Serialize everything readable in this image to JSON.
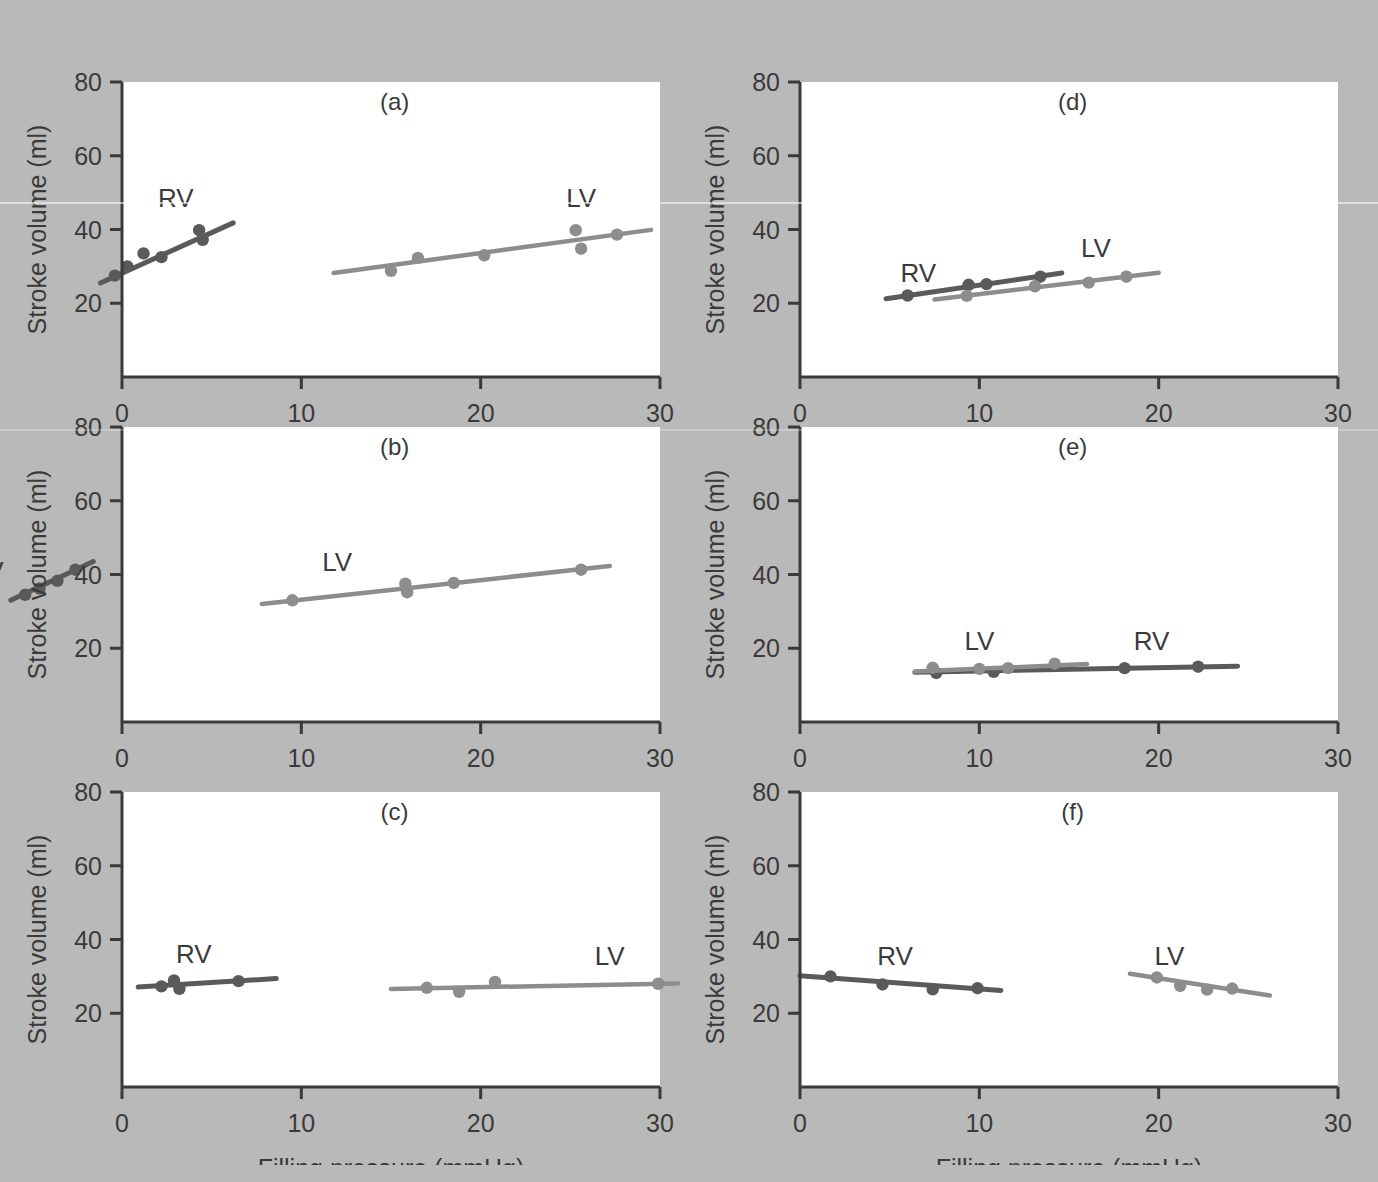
{
  "figure": {
    "background_color": "#b9b9b9",
    "plot_background_color": "#ffffff",
    "axis_color": "#3a3a3a",
    "rv_color": "#5a5a5a",
    "lv_color": "#8d8d8d",
    "x_axis_title": "Filling pressure (mmHg)",
    "y_axis_title": "Stroke volume (ml)",
    "x_ticks": [
      "0",
      "10",
      "20",
      "30"
    ],
    "y_ticks": [
      "20",
      "40",
      "60",
      "80"
    ],
    "series_labels": {
      "rv": "RV",
      "lv": "LV"
    },
    "panel_letters": [
      "(a)",
      "(b)",
      "(c)",
      "(d)",
      "(e)",
      "(f)"
    ]
  },
  "chart_data": [
    {
      "type": "scatter",
      "title": "(a)",
      "xlabel": "Filling pressure (mmHg)",
      "ylabel": "Stroke volume (ml)",
      "xlim": [
        0,
        30
      ],
      "ylim": [
        0,
        80
      ],
      "xticks": [
        0,
        10,
        20,
        30
      ],
      "yticks": [
        20,
        40,
        60,
        80
      ],
      "grid": false,
      "legend": "inline-annotation",
      "series": [
        {
          "name": "RV",
          "color": "#5a5a5a",
          "points": [
            {
              "x": -0.4,
              "y": 27.5
            },
            {
              "x": 0.3,
              "y": 30.0
            },
            {
              "x": 1.2,
              "y": 33.5
            },
            {
              "x": 2.2,
              "y": 32.5
            },
            {
              "x": 4.3,
              "y": 39.8
            },
            {
              "x": 4.5,
              "y": 37.2
            }
          ],
          "fit_line": {
            "x0": -1.2,
            "y0": 25.5,
            "x1": 6.2,
            "y1": 41.8
          }
        },
        {
          "name": "LV",
          "color": "#8d8d8d",
          "points": [
            {
              "x": 15.0,
              "y": 28.8
            },
            {
              "x": 16.5,
              "y": 32.3
            },
            {
              "x": 20.2,
              "y": 33.0
            },
            {
              "x": 25.3,
              "y": 39.8
            },
            {
              "x": 25.6,
              "y": 34.8
            },
            {
              "x": 27.6,
              "y": 38.6
            }
          ],
          "fit_line": {
            "x0": 11.8,
            "y0": 28.2,
            "x1": 29.5,
            "y1": 39.9
          }
        }
      ]
    },
    {
      "type": "scatter",
      "title": "(b)",
      "xlabel": "Filling pressure (mmHg)",
      "ylabel": "Stroke volume (ml)",
      "xlim": [
        0,
        30
      ],
      "ylim": [
        0,
        80
      ],
      "xticks": [
        0,
        10,
        20,
        30
      ],
      "yticks": [
        20,
        40,
        60,
        80
      ],
      "grid": false,
      "legend": "inline-annotation",
      "note": "RV cluster plotted outside the axes, to the left of the y-axis",
      "series": [
        {
          "name": "RV",
          "color": "#5a5a5a",
          "points": [
            {
              "x": -5.4,
              "y": 34.5
            },
            {
              "x": -4.6,
              "y": 36.2
            },
            {
              "x": -3.6,
              "y": 38.3
            },
            {
              "x": -2.6,
              "y": 41.3
            }
          ],
          "fit_line": {
            "x0": -6.2,
            "y0": 33.0,
            "x1": -1.6,
            "y1": 43.5
          }
        },
        {
          "name": "LV",
          "color": "#8d8d8d",
          "points": [
            {
              "x": 9.5,
              "y": 33.0
            },
            {
              "x": 15.8,
              "y": 37.5
            },
            {
              "x": 15.9,
              "y": 35.2
            },
            {
              "x": 18.5,
              "y": 37.7
            },
            {
              "x": 25.6,
              "y": 41.3
            }
          ],
          "fit_line": {
            "x0": 7.8,
            "y0": 32.0,
            "x1": 27.2,
            "y1": 42.3
          }
        }
      ]
    },
    {
      "type": "scatter",
      "title": "(c)",
      "xlabel": "Filling pressure (mmHg)",
      "ylabel": "Stroke volume (ml)",
      "xlim": [
        0,
        30
      ],
      "ylim": [
        0,
        80
      ],
      "xticks": [
        0,
        10,
        20,
        30
      ],
      "yticks": [
        20,
        40,
        60,
        80
      ],
      "grid": false,
      "legend": "inline-annotation",
      "series": [
        {
          "name": "RV",
          "color": "#5a5a5a",
          "points": [
            {
              "x": 2.2,
              "y": 27.3
            },
            {
              "x": 2.9,
              "y": 28.9
            },
            {
              "x": 3.2,
              "y": 26.6
            },
            {
              "x": 6.5,
              "y": 28.7
            }
          ],
          "fit_line": {
            "x0": 0.9,
            "y0": 27.1,
            "x1": 8.6,
            "y1": 29.4
          }
        },
        {
          "name": "LV",
          "color": "#8d8d8d",
          "points": [
            {
              "x": 17.0,
              "y": 26.9
            },
            {
              "x": 18.8,
              "y": 25.8
            },
            {
              "x": 20.8,
              "y": 28.5
            },
            {
              "x": 29.9,
              "y": 28.0
            }
          ],
          "fit_line": {
            "x0": 15.0,
            "y0": 26.6,
            "x1": 31.0,
            "y1": 28.1
          }
        }
      ]
    },
    {
      "type": "scatter",
      "title": "(d)",
      "xlabel": "Filling pressure (mmHg)",
      "ylabel": "Stroke volume (ml)",
      "xlim": [
        0,
        30
      ],
      "ylim": [
        0,
        80
      ],
      "xticks": [
        0,
        10,
        20,
        30
      ],
      "yticks": [
        20,
        40,
        60,
        80
      ],
      "grid": false,
      "legend": "inline-annotation",
      "series": [
        {
          "name": "RV",
          "color": "#5a5a5a",
          "points": [
            {
              "x": 6.0,
              "y": 22.1
            },
            {
              "x": 9.4,
              "y": 25.0
            },
            {
              "x": 10.4,
              "y": 25.2
            },
            {
              "x": 13.4,
              "y": 27.2
            }
          ],
          "fit_line": {
            "x0": 4.8,
            "y0": 21.2,
            "x1": 14.6,
            "y1": 28.2
          }
        },
        {
          "name": "LV",
          "color": "#8d8d8d",
          "points": [
            {
              "x": 9.3,
              "y": 22.0
            },
            {
              "x": 13.1,
              "y": 24.6
            },
            {
              "x": 16.1,
              "y": 25.6
            },
            {
              "x": 18.2,
              "y": 27.2
            }
          ],
          "fit_line": {
            "x0": 7.5,
            "y0": 21.0,
            "x1": 20.0,
            "y1": 28.3
          }
        }
      ]
    },
    {
      "type": "scatter",
      "title": "(e)",
      "xlabel": "Filling pressure (mmHg)",
      "ylabel": "Stroke volume (ml)",
      "xlim": [
        0,
        30
      ],
      "ylim": [
        0,
        80
      ],
      "xticks": [
        0,
        10,
        20,
        30
      ],
      "yticks": [
        20,
        40,
        60,
        80
      ],
      "grid": false,
      "legend": "inline-annotation",
      "series": [
        {
          "name": "RV",
          "color": "#5a5a5a",
          "points": [
            {
              "x": 7.6,
              "y": 13.3
            },
            {
              "x": 10.8,
              "y": 13.6
            },
            {
              "x": 18.1,
              "y": 14.6
            },
            {
              "x": 22.2,
              "y": 15.0
            }
          ],
          "fit_line": {
            "x0": 6.4,
            "y0": 13.5,
            "x1": 24.4,
            "y1": 15.1
          }
        },
        {
          "name": "LV",
          "color": "#8d8d8d",
          "points": [
            {
              "x": 7.4,
              "y": 14.7
            },
            {
              "x": 10.0,
              "y": 14.4
            },
            {
              "x": 11.6,
              "y": 14.6
            },
            {
              "x": 14.2,
              "y": 15.8
            }
          ],
          "fit_line": {
            "x0": 6.4,
            "y0": 13.7,
            "x1": 16.0,
            "y1": 15.7
          }
        }
      ]
    },
    {
      "type": "scatter",
      "title": "(f)",
      "xlabel": "Filling pressure (mmHg)",
      "ylabel": "Stroke volume (ml)",
      "xlim": [
        0,
        30
      ],
      "ylim": [
        0,
        80
      ],
      "xticks": [
        0,
        10,
        20,
        30
      ],
      "yticks": [
        20,
        40,
        60,
        80
      ],
      "grid": false,
      "legend": "inline-annotation",
      "series": [
        {
          "name": "RV",
          "color": "#5a5a5a",
          "points": [
            {
              "x": 1.7,
              "y": 30.0
            },
            {
              "x": 4.6,
              "y": 27.8
            },
            {
              "x": 7.4,
              "y": 26.5
            },
            {
              "x": 9.9,
              "y": 26.8
            }
          ],
          "fit_line": {
            "x0": 0.0,
            "y0": 30.2,
            "x1": 11.2,
            "y1": 26.2
          }
        },
        {
          "name": "LV",
          "color": "#8d8d8d",
          "points": [
            {
              "x": 19.9,
              "y": 29.7
            },
            {
              "x": 21.2,
              "y": 27.4
            },
            {
              "x": 22.7,
              "y": 26.4
            },
            {
              "x": 24.1,
              "y": 26.7
            }
          ],
          "fit_line": {
            "x0": 18.4,
            "y0": 30.7,
            "x1": 26.2,
            "y1": 24.8
          }
        }
      ]
    }
  ]
}
